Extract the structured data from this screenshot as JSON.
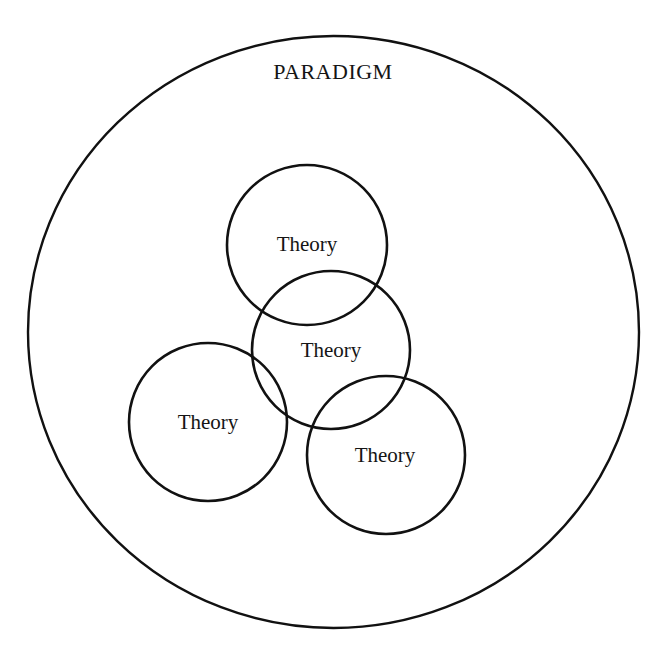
{
  "diagram": {
    "title": "PARADIGM",
    "outer": {
      "label": "PARADIGM",
      "cx": 333.5,
      "cy": 332,
      "rx": 305.5,
      "ry": 296,
      "label_x": 333,
      "label_y": 72
    },
    "theories": [
      {
        "label": "Theory",
        "cx": 307,
        "cy": 245,
        "r": 80,
        "label_x": 307,
        "label_y": 244
      },
      {
        "label": "Theory",
        "cx": 331,
        "cy": 350,
        "r": 79,
        "label_x": 331,
        "label_y": 350
      },
      {
        "label": "Theory",
        "cx": 208,
        "cy": 422,
        "r": 79,
        "label_x": 208,
        "label_y": 422
      },
      {
        "label": "Theory",
        "cx": 386,
        "cy": 455,
        "r": 79,
        "label_x": 385,
        "label_y": 455
      }
    ],
    "colors": {
      "stroke": "#111111",
      "text": "#151515",
      "background": "#ffffff"
    }
  }
}
